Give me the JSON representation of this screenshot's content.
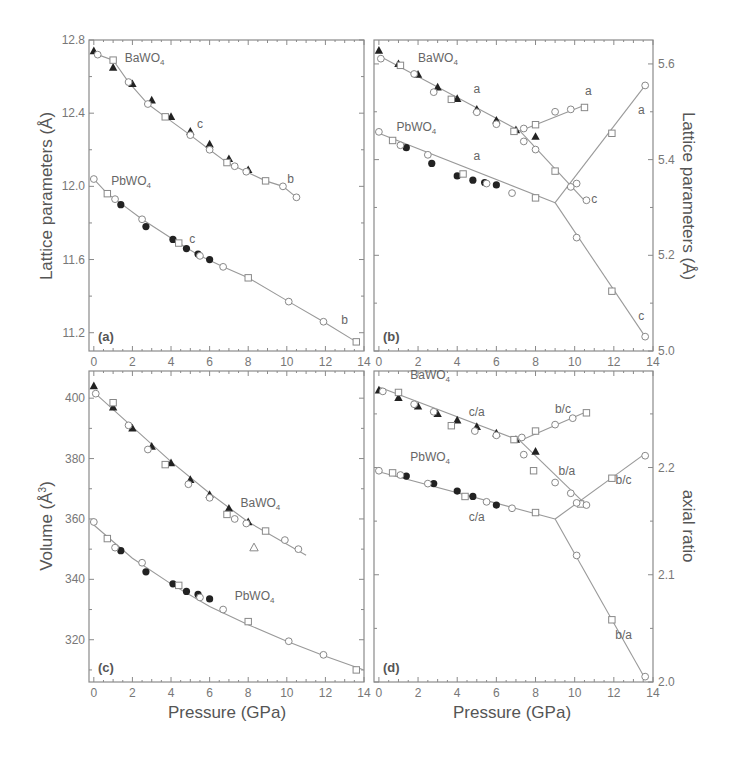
{
  "figure": {
    "x_axis_label": "Pressure (GPa)",
    "x_ticks": [
      "0",
      "2",
      "4",
      "6",
      "8",
      "10",
      "12",
      "14"
    ]
  },
  "chart_data": [
    {
      "panel": "(a)",
      "type": "scatter",
      "title": "",
      "xlabel": "",
      "ylabel": "Lattice parameters (Å)",
      "xlim": [
        -0.25,
        14
      ],
      "ylim": [
        11.1,
        12.8
      ],
      "x_ticks": [
        0,
        2,
        4,
        6,
        8,
        10,
        12,
        14
      ],
      "y_ticks": [
        11.2,
        11.6,
        12.0,
        12.4,
        12.8
      ],
      "y_axis_side": "left",
      "annotations": [
        {
          "text": "BaWO4",
          "x": 1.6,
          "y": 12.68
        },
        {
          "text": "c",
          "x": 5.5,
          "y": 12.32
        },
        {
          "text": "b",
          "x": 10.2,
          "y": 12.02
        },
        {
          "text": "PbWO4",
          "x": 0.9,
          "y": 12.01
        },
        {
          "text": "c",
          "x": 5.1,
          "y": 11.69
        },
        {
          "text": "b",
          "x": 13.0,
          "y": 11.25
        }
      ],
      "series": [
        {
          "name": "BaWO4 filled triangles",
          "marker": "triangle-filled",
          "x": [
            0,
            1,
            2,
            3,
            4,
            5,
            6,
            7,
            8
          ],
          "y": [
            12.74,
            12.65,
            12.56,
            12.47,
            12.38,
            12.3,
            12.23,
            12.15,
            12.09
          ]
        },
        {
          "name": "BaWO4 open circles/squares",
          "marker": "open",
          "x": [
            0.2,
            1.0,
            1.8,
            2.8,
            3.7,
            5.0,
            6.0,
            6.9,
            7.3,
            7.9,
            8.9,
            9.8,
            10.5
          ],
          "y": [
            12.72,
            12.69,
            12.57,
            12.45,
            12.38,
            12.28,
            12.2,
            12.13,
            12.11,
            12.08,
            12.03,
            12.0,
            11.94
          ],
          "fit_line": "BaWO4 b,c fit"
        },
        {
          "name": "PbWO4 filled circles",
          "marker": "circle-filled",
          "x": [
            1.4,
            2.7,
            4.1,
            4.8,
            5.4,
            6.0
          ],
          "y": [
            11.9,
            11.78,
            11.71,
            11.66,
            11.63,
            11.6
          ]
        },
        {
          "name": "PbWO4 open circles/squares",
          "marker": "open",
          "x": [
            0,
            0.7,
            1.1,
            2.5,
            4.4,
            5.5,
            6.7,
            8.0,
            10.1,
            11.9,
            13.6
          ],
          "y": [
            12.04,
            11.96,
            11.93,
            11.82,
            11.69,
            11.62,
            11.56,
            11.5,
            11.37,
            11.26,
            11.15
          ]
        }
      ]
    },
    {
      "panel": "(b)",
      "type": "scatter",
      "title": "",
      "xlabel": "",
      "ylabel": "Lattice parameters (Å)",
      "xlim": [
        -0.25,
        14
      ],
      "ylim": [
        5.0,
        5.65
      ],
      "x_ticks": [
        0,
        2,
        4,
        6,
        8,
        10,
        12,
        14
      ],
      "y_ticks": [
        5.0,
        5.2,
        5.4,
        5.6
      ],
      "y_axis_side": "right",
      "annotations": [
        {
          "text": "BaWO4",
          "x": 2.0,
          "y": 5.605
        },
        {
          "text": "a",
          "x": 5.0,
          "y": 5.54
        },
        {
          "text": "a",
          "x": 10.7,
          "y": 5.535
        },
        {
          "text": "c",
          "x": 11.0,
          "y": 5.31
        },
        {
          "text": "PbWO4",
          "x": 0.9,
          "y": 5.46
        },
        {
          "text": "a",
          "x": 5.0,
          "y": 5.4
        },
        {
          "text": "a",
          "x": 13.4,
          "y": 5.495
        },
        {
          "text": "c",
          "x": 13.4,
          "y": 5.065
        }
      ],
      "series": [
        {
          "name": "BaWO4 filled triangles",
          "marker": "triangle-filled",
          "x": [
            0,
            1,
            2,
            3,
            4,
            5,
            6,
            7,
            8
          ],
          "y": [
            5.628,
            5.6,
            5.578,
            5.551,
            5.527,
            5.505,
            5.482,
            5.462,
            5.448
          ]
        },
        {
          "name": "BaWO4 open (a, low-P)",
          "marker": "open",
          "x": [
            0.1,
            1.1,
            1.8,
            2.8,
            3.7,
            5.0,
            6.0,
            6.9,
            7.4,
            8.0,
            9.0,
            9.8,
            10.6
          ],
          "y": [
            5.611,
            5.597,
            5.579,
            5.541,
            5.526,
            5.499,
            5.474,
            5.459,
            5.438,
            5.421,
            5.376,
            5.343,
            5.315
          ]
        },
        {
          "name": "BaWO4 open (a, high-P branch)",
          "marker": "open",
          "x": [
            7.4,
            8.0,
            9.0,
            9.8,
            10.5
          ],
          "y": [
            5.465,
            5.473,
            5.5,
            5.505,
            5.509
          ]
        },
        {
          "name": "PbWO4 filled circles",
          "marker": "circle-filled",
          "x": [
            1.4,
            2.7,
            4.0,
            4.8,
            5.4,
            6.0
          ],
          "y": [
            5.425,
            5.392,
            5.366,
            5.357,
            5.352,
            5.347
          ]
        },
        {
          "name": "PbWO4 open (a)",
          "marker": "open",
          "x": [
            0,
            0.7,
            1.1,
            2.5,
            4.3,
            5.5,
            6.8,
            8.0
          ],
          "y": [
            5.458,
            5.44,
            5.43,
            5.41,
            5.37,
            5.35,
            5.33,
            5.32
          ]
        },
        {
          "name": "PbWO4 high-P a",
          "marker": "open",
          "x": [
            10.1,
            11.9,
            13.6
          ],
          "y": [
            5.35,
            5.455,
            5.555
          ]
        },
        {
          "name": "PbWO4 high-P c",
          "marker": "open",
          "x": [
            10.1,
            11.9,
            13.6
          ],
          "y": [
            5.237,
            5.125,
            5.03
          ]
        }
      ],
      "lines": [
        {
          "name": "BaWO4 a fit",
          "x": [
            0,
            7.2
          ],
          "y": [
            5.617,
            5.46
          ]
        },
        {
          "name": "BaWO4 a high-P",
          "x": [
            7.2,
            10.6
          ],
          "y": [
            5.46,
            5.515
          ]
        },
        {
          "name": "BaWO4 c high-P",
          "x": [
            7.2,
            10.6
          ],
          "y": [
            5.46,
            5.31
          ]
        },
        {
          "name": "PbWO4 a fit",
          "x": [
            0,
            9.0
          ],
          "y": [
            5.455,
            5.31
          ]
        },
        {
          "name": "PbWO4 a high-P",
          "x": [
            9.0,
            13.6
          ],
          "y": [
            5.31,
            5.555
          ]
        },
        {
          "name": "PbWO4 c high-P",
          "x": [
            9.0,
            13.6
          ],
          "y": [
            5.31,
            5.03
          ]
        }
      ]
    },
    {
      "panel": "(c)",
      "type": "scatter",
      "title": "",
      "xlabel": "Pressure (GPa)",
      "ylabel": "Volume (Å3)",
      "xlim": [
        -0.25,
        14
      ],
      "ylim": [
        306,
        409
      ],
      "x_ticks": [
        0,
        2,
        4,
        6,
        8,
        10,
        12,
        14
      ],
      "y_ticks": [
        320,
        340,
        360,
        380,
        400
      ],
      "y_axis_side": "left",
      "annotations": [
        {
          "text": "BaWO4",
          "x": 7.6,
          "y": 364
        },
        {
          "text": "PbWO4",
          "x": 7.3,
          "y": 333
        }
      ],
      "series": [
        {
          "name": "BaWO4 filled triangles",
          "marker": "triangle-filled",
          "x": [
            0,
            1,
            2,
            3,
            4,
            5,
            6,
            7,
            8
          ],
          "y": [
            404,
            397,
            390,
            384,
            378.5,
            373,
            368,
            363.5,
            359
          ]
        },
        {
          "name": "BaWO4 open",
          "marker": "open",
          "x": [
            0.1,
            1.0,
            1.8,
            2.8,
            3.7,
            4.9,
            6.0,
            6.9,
            7.3,
            7.9,
            8.9,
            9.9,
            10.6
          ],
          "y": [
            401.5,
            398.5,
            391,
            383,
            378,
            371.5,
            367,
            361.5,
            360,
            358.5,
            356,
            353,
            350
          ]
        },
        {
          "name": "BaWO4 open triangle outlier",
          "marker": "triangle-open",
          "x": [
            8.3
          ],
          "y": [
            350.5
          ]
        },
        {
          "name": "PbWO4 filled circles",
          "marker": "circle-filled",
          "x": [
            1.4,
            2.7,
            4.1,
            4.8,
            5.4,
            6.0
          ],
          "y": [
            349.5,
            342.5,
            338.5,
            336,
            335,
            333.5
          ]
        },
        {
          "name": "PbWO4 open",
          "marker": "open",
          "x": [
            0,
            0.7,
            1.1,
            2.5,
            4.4,
            5.5,
            6.7,
            8.0,
            10.1,
            11.9,
            13.6
          ],
          "y": [
            359,
            353.5,
            350.5,
            345.5,
            338,
            334,
            330,
            326,
            319.5,
            315,
            310
          ]
        }
      ],
      "lines": [
        {
          "name": "BaWO4 EOS fit",
          "x": [
            0,
            2,
            4,
            6,
            8,
            11
          ],
          "y": [
            402,
            390.5,
            379,
            368.5,
            359,
            348
          ]
        },
        {
          "name": "PbWO4 EOS fit",
          "x": [
            0,
            2,
            4,
            6,
            8,
            10,
            12,
            14
          ],
          "y": [
            358,
            347,
            338.5,
            331,
            325,
            319.5,
            314.5,
            310
          ]
        }
      ]
    },
    {
      "panel": "(d)",
      "type": "scatter",
      "title": "",
      "xlabel": "Pressure (GPa)",
      "ylabel": "axial ratio",
      "xlim": [
        -0.25,
        14
      ],
      "ylim": [
        2.0,
        2.29
      ],
      "x_ticks": [
        0,
        2,
        4,
        6,
        8,
        10,
        12,
        14
      ],
      "y_ticks": [
        2.0,
        2.1,
        2.2
      ],
      "y_axis_side": "right",
      "annotations": [
        {
          "text": "BaWO4",
          "x": 1.6,
          "y": 2.283
        },
        {
          "text": "c/a",
          "x": 5.0,
          "y": 2.248
        },
        {
          "text": "b/c",
          "x": 9.4,
          "y": 2.251
        },
        {
          "text": "b/a",
          "x": 9.6,
          "y": 2.193
        },
        {
          "text": "PbWO4",
          "x": 1.6,
          "y": 2.206
        },
        {
          "text": "c/a",
          "x": 5.0,
          "y": 2.15
        },
        {
          "text": "b/c",
          "x": 12.5,
          "y": 2.185
        },
        {
          "text": "b/a",
          "x": 12.5,
          "y": 2.04
        }
      ],
      "series": [
        {
          "name": "BaWO4 filled triangles",
          "marker": "triangle-filled",
          "x": [
            0,
            1,
            2,
            3,
            4,
            5,
            6,
            7,
            8
          ],
          "y": [
            2.272,
            2.265,
            2.257,
            2.25,
            2.244,
            2.238,
            2.232,
            2.226,
            2.215
          ]
        },
        {
          "name": "BaWO4 open (c/a)",
          "marker": "open",
          "x": [
            0.2,
            1.0,
            1.8,
            2.8,
            3.7,
            4.9,
            6.0,
            6.9
          ],
          "y": [
            2.271,
            2.27,
            2.259,
            2.252,
            2.239,
            2.234,
            2.23,
            2.226
          ]
        },
        {
          "name": "BaWO4 open (b/c)",
          "marker": "open",
          "x": [
            7.3,
            8.0,
            9.0,
            9.9,
            10.6
          ],
          "y": [
            2.228,
            2.234,
            2.24,
            2.246,
            2.251
          ]
        },
        {
          "name": "BaWO4 open (b/a)",
          "marker": "open",
          "x": [
            7.4,
            7.9,
            9.0,
            9.8,
            10.3,
            10.6
          ],
          "y": [
            2.212,
            2.197,
            2.186,
            2.176,
            2.166,
            2.165
          ]
        },
        {
          "name": "PbWO4 filled circles",
          "marker": "circle-filled",
          "x": [
            1.4,
            2.8,
            4.0,
            4.8,
            6.0
          ],
          "y": [
            2.192,
            2.185,
            2.178,
            2.173,
            2.165
          ]
        },
        {
          "name": "PbWO4 open (c/a)",
          "marker": "open",
          "x": [
            0,
            0.7,
            1.1,
            2.5,
            4.4,
            5.5,
            6.8,
            8.0
          ],
          "y": [
            2.197,
            2.195,
            2.193,
            2.185,
            2.173,
            2.168,
            2.162,
            2.158
          ]
        },
        {
          "name": "PbWO4 high-P b/c",
          "marker": "open",
          "x": [
            10.1,
            11.9,
            13.6
          ],
          "y": [
            2.167,
            2.19,
            2.211
          ]
        },
        {
          "name": "PbWO4 high-P b/a",
          "marker": "open",
          "x": [
            10.1,
            11.9,
            13.6
          ],
          "y": [
            2.118,
            2.058,
            2.005
          ]
        }
      ],
      "lines": [
        {
          "name": "BaWO4 c/a fit",
          "x": [
            0,
            7.2
          ],
          "y": [
            2.275,
            2.225
          ]
        },
        {
          "name": "BaWO4 b/c",
          "x": [
            7.2,
            10.6
          ],
          "y": [
            2.225,
            2.252
          ]
        },
        {
          "name": "BaWO4 b/a",
          "x": [
            7.2,
            10.6
          ],
          "y": [
            2.225,
            2.165
          ]
        },
        {
          "name": "PbWO4 c/a fit",
          "x": [
            0,
            9.0
          ],
          "y": [
            2.196,
            2.152
          ]
        },
        {
          "name": "PbWO4 b/c",
          "x": [
            9.0,
            13.6
          ],
          "y": [
            2.152,
            2.213
          ]
        },
        {
          "name": "PbWO4 b/a",
          "x": [
            9.0,
            13.6
          ],
          "y": [
            2.152,
            2.003
          ]
        }
      ]
    }
  ],
  "layout": {
    "panels": [
      {
        "id": "a",
        "left": 89,
        "top": 40,
        "right": 364,
        "bottom": 351
      },
      {
        "id": "b",
        "left": 374,
        "top": 40,
        "right": 653,
        "bottom": 351
      },
      {
        "id": "c",
        "left": 89,
        "top": 371,
        "right": 364,
        "bottom": 682
      },
      {
        "id": "d",
        "left": 374,
        "top": 371,
        "right": 653,
        "bottom": 682
      }
    ],
    "colors": {
      "frame": "#8a8a8a",
      "fit_line": "#999999",
      "filled_marker": "#222222",
      "open_marker": "#888888",
      "text": "#555555"
    }
  }
}
